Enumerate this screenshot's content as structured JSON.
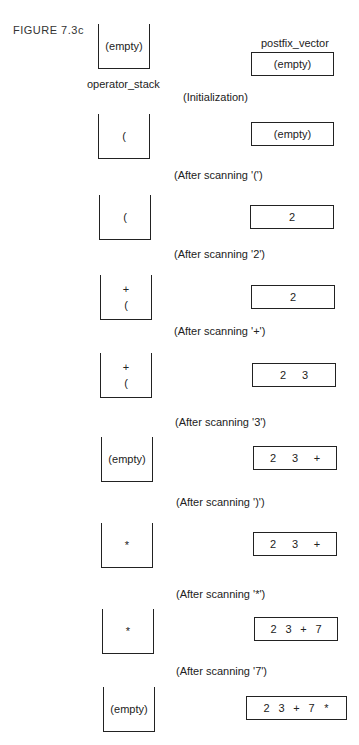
{
  "figure_label": "FIGURE 7.3c",
  "labels": {
    "operator_stack": "operator_stack",
    "postfix_vector": "postfix_vector"
  },
  "steps": [
    {
      "stack": [
        "(empty)"
      ],
      "postfix": [
        "(empty)"
      ],
      "caption": "(Initialization)"
    },
    {
      "stack": [
        "("
      ],
      "postfix": [
        "(empty)"
      ],
      "caption": "(After scanning '(')"
    },
    {
      "stack": [
        "("
      ],
      "postfix": [
        "2"
      ],
      "caption": "(After scanning '2')"
    },
    {
      "stack": [
        "+",
        "("
      ],
      "postfix": [
        "2"
      ],
      "caption": "(After scanning '+')"
    },
    {
      "stack": [
        "+",
        "("
      ],
      "postfix": [
        "2",
        "3"
      ],
      "caption": "(After scanning '3')"
    },
    {
      "stack": [
        "(empty)"
      ],
      "postfix": [
        "2",
        "3",
        "+"
      ],
      "caption": "(After scanning ')')"
    },
    {
      "stack": [
        "*"
      ],
      "postfix": [
        "2",
        "3",
        "+"
      ],
      "caption": "(After scanning '*')"
    },
    {
      "stack": [
        "*"
      ],
      "postfix": [
        "2",
        "3",
        "+",
        "7"
      ],
      "caption": "(After scanning '7')"
    },
    {
      "stack": [
        "(empty)"
      ],
      "postfix": [
        "2",
        "3",
        "+",
        "7",
        "*"
      ],
      "caption": ""
    }
  ]
}
